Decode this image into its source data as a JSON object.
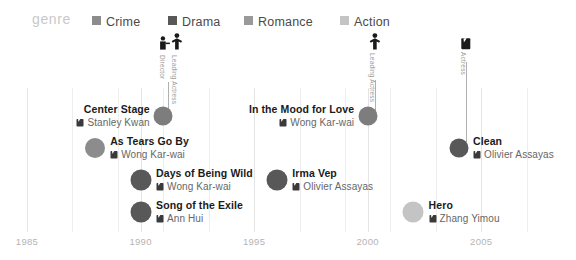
{
  "legend": {
    "title": "genre",
    "items": [
      {
        "label": "Crime",
        "color": "#8c8c8c"
      },
      {
        "label": "Drama",
        "color": "#585858"
      },
      {
        "label": "Romance",
        "color": "#9a9a9a"
      },
      {
        "label": "Action",
        "color": "#c4c4c4"
      }
    ]
  },
  "axis": {
    "ticks": [
      "1985",
      "1990",
      "1995",
      "2000",
      "2005"
    ],
    "minor_gridlines": 13
  },
  "annotations": [
    {
      "label": "Director",
      "icon": "director-icon"
    },
    {
      "label": "Leading Actress",
      "icon": "actress-icon"
    },
    {
      "label": "Leading Actress",
      "icon": "actress-icon"
    },
    {
      "label": "Actress",
      "icon": "film-clapper-icon"
    }
  ],
  "chart_data": {
    "type": "scatter",
    "title": "genre",
    "xlabel": "",
    "ylabel": "",
    "xlim": [
      1984,
      2008
    ],
    "grid": true,
    "legend_position": "top",
    "categories": [
      "Crime",
      "Drama",
      "Romance",
      "Action"
    ],
    "points": [
      {
        "title": "Center Stage",
        "director": "Stanley Kwan",
        "year": 1991,
        "genre": "Drama",
        "color": "#7d7d7d",
        "align": "left"
      },
      {
        "title": "As Tears Go By",
        "director": "Wong Kar-wai",
        "year": 1988,
        "genre": "Crime",
        "color": "#8c8c8c",
        "align": "right"
      },
      {
        "title": "Days of Being Wild",
        "director": "Wong Kar-wai",
        "year": 1990,
        "genre": "Drama",
        "color": "#585858",
        "align": "right"
      },
      {
        "title": "Song of the Exile",
        "director": "Ann Hui",
        "year": 1990,
        "genre": "Drama",
        "color": "#585858",
        "align": "right"
      },
      {
        "title": "In the Mood for Love",
        "director": "Wong Kar-wai",
        "year": 2000,
        "genre": "Romance",
        "color": "#7d7d7d",
        "align": "left"
      },
      {
        "title": "Irma Vep",
        "director": "Olivier Assayas",
        "year": 1996,
        "genre": "Drama",
        "color": "#585858",
        "align": "right"
      },
      {
        "title": "Clean",
        "director": "Olivier Assayas",
        "year": 2004,
        "genre": "Drama",
        "color": "#585858",
        "align": "right"
      },
      {
        "title": "Hero",
        "director": "Zhang Yimou",
        "year": 2002,
        "genre": "Action",
        "color": "#c4c4c4",
        "align": "right"
      }
    ]
  }
}
